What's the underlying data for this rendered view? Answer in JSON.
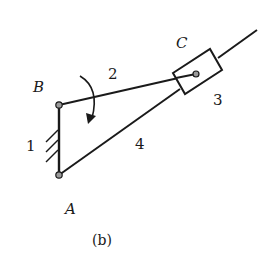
{
  "figure": {
    "caption": "(b)",
    "type": "mechanism-schematic"
  },
  "joints": {
    "A": {
      "label": "A",
      "x": 59,
      "y": 175
    },
    "B": {
      "label": "B",
      "x": 59,
      "y": 105
    },
    "C": {
      "label": "C",
      "x": 196,
      "y": 74
    }
  },
  "links": [
    {
      "id": "1",
      "label": "1",
      "role": "fixed frame (ground)"
    },
    {
      "id": "2",
      "label": "2",
      "role": "link B-C"
    },
    {
      "id": "3",
      "label": "3",
      "role": "slider block"
    },
    {
      "id": "4",
      "label": "4",
      "role": "guide bar from A"
    }
  ],
  "annotations": {
    "rotation_arrow": "clockwise",
    "colors": {
      "stroke": "#1a1a1a",
      "joint_fill": "#9a9a9a",
      "background": "#ffffff"
    }
  }
}
